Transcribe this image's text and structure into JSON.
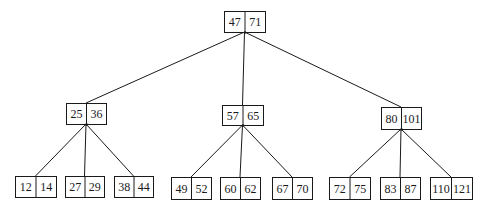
{
  "diagram": {
    "type": "b-tree",
    "colors": {
      "stroke": "#1a1a1a",
      "background": "#ffffff",
      "text": "#1a1a1a"
    },
    "nodes": [
      {
        "id": "root",
        "keys": [
          "47",
          "71"
        ],
        "x": 224,
        "y": 11,
        "w": 41,
        "h": 21
      },
      {
        "id": "n1",
        "keys": [
          "25",
          "36"
        ],
        "x": 66,
        "y": 103,
        "w": 40,
        "h": 21
      },
      {
        "id": "n2",
        "keys": [
          "57",
          "65"
        ],
        "x": 222,
        "y": 105,
        "w": 41,
        "h": 20
      },
      {
        "id": "n3",
        "keys": [
          "80",
          "101"
        ],
        "x": 381,
        "y": 107,
        "w": 40,
        "h": 22
      },
      {
        "id": "l1",
        "keys": [
          "12",
          "14"
        ],
        "x": 15,
        "y": 176,
        "w": 41,
        "h": 21
      },
      {
        "id": "l2",
        "keys": [
          "27",
          "29"
        ],
        "x": 65,
        "y": 176,
        "w": 39,
        "h": 21
      },
      {
        "id": "l3",
        "keys": [
          "38",
          "44"
        ],
        "x": 114,
        "y": 176,
        "w": 39,
        "h": 21
      },
      {
        "id": "l4",
        "keys": [
          "49",
          "52"
        ],
        "x": 171,
        "y": 177,
        "w": 40,
        "h": 22
      },
      {
        "id": "l5",
        "keys": [
          "60",
          "62"
        ],
        "x": 220,
        "y": 177,
        "w": 40,
        "h": 22
      },
      {
        "id": "l6",
        "keys": [
          "67",
          "70"
        ],
        "x": 272,
        "y": 177,
        "w": 40,
        "h": 22
      },
      {
        "id": "l7",
        "keys": [
          "72",
          "75"
        ],
        "x": 329,
        "y": 177,
        "w": 41,
        "h": 22
      },
      {
        "id": "l8",
        "keys": [
          "83",
          "87"
        ],
        "x": 380,
        "y": 177,
        "w": 40,
        "h": 22
      },
      {
        "id": "l9",
        "keys": [
          "110",
          "121"
        ],
        "x": 430,
        "y": 177,
        "w": 42,
        "h": 22
      }
    ],
    "edges": [
      {
        "from": "root",
        "to": "n1"
      },
      {
        "from": "root",
        "to": "n2"
      },
      {
        "from": "root",
        "to": "n3"
      },
      {
        "from": "n1",
        "to": "l1"
      },
      {
        "from": "n1",
        "to": "l2"
      },
      {
        "from": "n1",
        "to": "l3"
      },
      {
        "from": "n2",
        "to": "l4"
      },
      {
        "from": "n2",
        "to": "l5"
      },
      {
        "from": "n2",
        "to": "l6"
      },
      {
        "from": "n3",
        "to": "l7"
      },
      {
        "from": "n3",
        "to": "l8"
      },
      {
        "from": "n3",
        "to": "l9"
      }
    ]
  }
}
